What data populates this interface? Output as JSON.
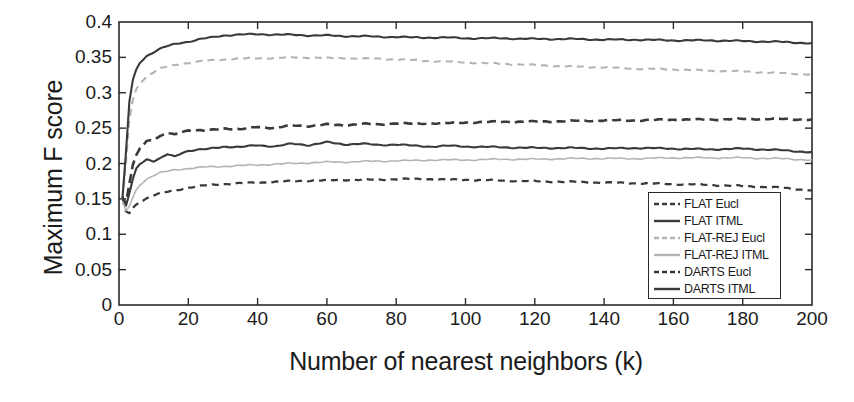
{
  "chart_data": {
    "type": "line",
    "title": "",
    "xlabel": "Number of nearest neighbors (k)",
    "ylabel": "Maximum F score",
    "xlim": [
      0,
      200
    ],
    "ylim": [
      0,
      0.4
    ],
    "xticks": [
      0,
      20,
      40,
      60,
      80,
      100,
      120,
      140,
      160,
      180,
      200
    ],
    "yticks": [
      0,
      0.05,
      0.1,
      0.15,
      0.2,
      0.25,
      0.3,
      0.35,
      0.4
    ],
    "xtick_labels": [
      "0",
      "20",
      "40",
      "60",
      "80",
      "100",
      "120",
      "140",
      "160",
      "180",
      "200"
    ],
    "ytick_labels": [
      "0",
      "0.05",
      "0.1",
      "0.15",
      "0.2",
      "0.25",
      "0.3",
      "0.35",
      "0.4"
    ],
    "grid": false,
    "legend_position": "lower-right-inside",
    "x": [
      1,
      2,
      3,
      4,
      5,
      6,
      8,
      10,
      12,
      14,
      16,
      18,
      20,
      25,
      30,
      35,
      40,
      45,
      50,
      55,
      60,
      65,
      70,
      75,
      80,
      85,
      90,
      95,
      100,
      110,
      120,
      130,
      140,
      150,
      160,
      170,
      180,
      190,
      200
    ],
    "series": [
      {
        "name": "FLAT Eucl",
        "style": "dashed",
        "color": "#3a3a3a",
        "width": 2.3,
        "values": [
          0.15,
          0.132,
          0.13,
          0.137,
          0.142,
          0.146,
          0.151,
          0.155,
          0.158,
          0.16,
          0.162,
          0.164,
          0.166,
          0.169,
          0.171,
          0.172,
          0.173,
          0.174,
          0.175,
          0.176,
          0.176,
          0.177,
          0.177,
          0.177,
          0.178,
          0.178,
          0.178,
          0.177,
          0.177,
          0.176,
          0.175,
          0.174,
          0.173,
          0.172,
          0.171,
          0.17,
          0.168,
          0.166,
          0.162
        ]
      },
      {
        "name": "FLAT ITML",
        "style": "solid",
        "color": "#3a3a3a",
        "width": 2.1,
        "values": [
          0.152,
          0.14,
          0.158,
          0.178,
          0.193,
          0.2,
          0.206,
          0.203,
          0.207,
          0.213,
          0.21,
          0.215,
          0.218,
          0.22,
          0.224,
          0.223,
          0.226,
          0.224,
          0.228,
          0.226,
          0.23,
          0.227,
          0.228,
          0.226,
          0.227,
          0.225,
          0.224,
          0.225,
          0.224,
          0.223,
          0.222,
          0.222,
          0.221,
          0.222,
          0.221,
          0.22,
          0.221,
          0.219,
          0.216
        ]
      },
      {
        "name": "FLAT-REJ Eucl",
        "style": "dashed",
        "color": "#b4b4b4",
        "width": 2.1,
        "values": [
          0.148,
          0.2,
          0.262,
          0.29,
          0.305,
          0.314,
          0.323,
          0.329,
          0.334,
          0.337,
          0.339,
          0.341,
          0.342,
          0.345,
          0.347,
          0.348,
          0.349,
          0.349,
          0.35,
          0.35,
          0.349,
          0.349,
          0.348,
          0.348,
          0.347,
          0.346,
          0.345,
          0.344,
          0.343,
          0.341,
          0.339,
          0.337,
          0.336,
          0.334,
          0.333,
          0.331,
          0.33,
          0.328,
          0.326
        ]
      },
      {
        "name": "FLAT-REJ ITML",
        "style": "solid",
        "color": "#b4b4b4",
        "width": 1.6,
        "values": [
          0.146,
          0.133,
          0.14,
          0.152,
          0.163,
          0.17,
          0.178,
          0.183,
          0.187,
          0.189,
          0.191,
          0.192,
          0.193,
          0.195,
          0.196,
          0.197,
          0.198,
          0.199,
          0.2,
          0.201,
          0.202,
          0.202,
          0.203,
          0.203,
          0.204,
          0.204,
          0.205,
          0.205,
          0.205,
          0.206,
          0.206,
          0.207,
          0.207,
          0.207,
          0.208,
          0.208,
          0.208,
          0.207,
          0.205
        ]
      },
      {
        "name": "DARTS Eucl",
        "style": "dashed",
        "color": "#3a3a3a",
        "width": 2.6,
        "values": [
          0.151,
          0.143,
          0.172,
          0.198,
          0.212,
          0.222,
          0.232,
          0.234,
          0.238,
          0.243,
          0.241,
          0.245,
          0.247,
          0.246,
          0.25,
          0.248,
          0.252,
          0.25,
          0.254,
          0.253,
          0.255,
          0.254,
          0.256,
          0.255,
          0.257,
          0.256,
          0.257,
          0.257,
          0.258,
          0.259,
          0.259,
          0.26,
          0.261,
          0.261,
          0.262,
          0.262,
          0.263,
          0.263,
          0.262
        ]
      },
      {
        "name": "DARTS ITML",
        "style": "solid",
        "color": "#3a3a3a",
        "width": 2.1,
        "values": [
          0.15,
          0.215,
          0.288,
          0.318,
          0.333,
          0.343,
          0.352,
          0.357,
          0.362,
          0.366,
          0.369,
          0.371,
          0.372,
          0.377,
          0.381,
          0.382,
          0.383,
          0.382,
          0.382,
          0.381,
          0.381,
          0.38,
          0.38,
          0.379,
          0.379,
          0.378,
          0.378,
          0.378,
          0.377,
          0.377,
          0.376,
          0.376,
          0.375,
          0.375,
          0.374,
          0.374,
          0.373,
          0.372,
          0.37
        ]
      }
    ],
    "legend": [
      {
        "label": "FLAT Eucl",
        "style": "dashed",
        "color": "#3a3a3a"
      },
      {
        "label": "FLAT ITML",
        "style": "solid",
        "color": "#3a3a3a"
      },
      {
        "label": "FLAT-REJ Eucl",
        "style": "dashed",
        "color": "#b4b4b4"
      },
      {
        "label": "FLAT-REJ ITML",
        "style": "solid",
        "color": "#b4b4b4"
      },
      {
        "label": "DARTS Eucl",
        "style": "dashed",
        "color": "#3a3a3a"
      },
      {
        "label": "DARTS ITML",
        "style": "solid",
        "color": "#3a3a3a"
      }
    ]
  }
}
